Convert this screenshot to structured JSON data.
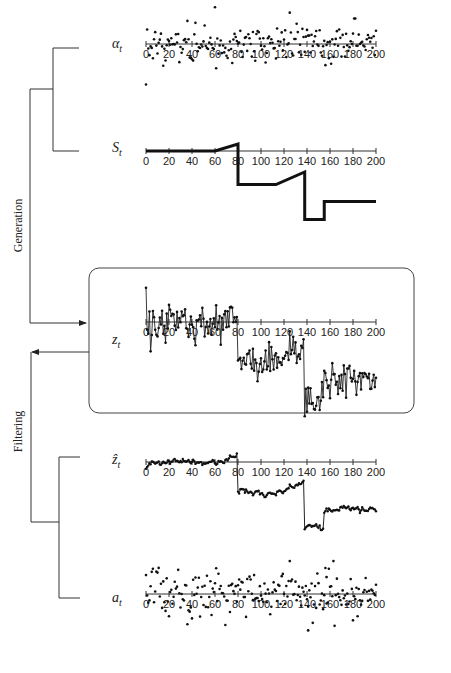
{
  "diagram": {
    "sections": {
      "generation_label": "Generation",
      "filtering_label": "Filtering"
    },
    "panels": [
      {
        "id": "alpha",
        "symbol": "α",
        "subscript": "t",
        "kind": "scatter",
        "description": "noise innovations"
      },
      {
        "id": "S",
        "symbol": "S",
        "subscript": "t",
        "kind": "step",
        "description": "structural signal"
      },
      {
        "id": "z",
        "symbol": "z",
        "subscript": "t",
        "kind": "line-markers",
        "description": "observed series (boxed)"
      },
      {
        "id": "zhat",
        "symbol": "ẑ",
        "subscript": "t",
        "kind": "line-markers",
        "description": "filtered series"
      },
      {
        "id": "a",
        "symbol": "a",
        "subscript": "t",
        "kind": "scatter",
        "description": "residuals"
      }
    ],
    "axis": {
      "ticks": [
        "0",
        "20",
        "40",
        "60",
        "80",
        "100",
        "120",
        "140",
        "160",
        "180",
        "200"
      ],
      "xmin": 0,
      "xmax": 200
    }
  },
  "chart_data": [
    {
      "type": "scatter",
      "title": "α_t",
      "x_range": [
        0,
        200
      ],
      "ticks": [
        0,
        20,
        40,
        60,
        80,
        100,
        120,
        140,
        160,
        180,
        200
      ],
      "seed": 11,
      "amplitude": 1.0,
      "note": "random white noise around zero, 200 points"
    },
    {
      "type": "line",
      "title": "S_t",
      "x_range": [
        0,
        200
      ],
      "ticks": [
        0,
        20,
        40,
        60,
        80,
        100,
        120,
        140,
        160,
        180,
        200
      ],
      "segments": [
        {
          "x": [
            0,
            60
          ],
          "y": [
            0,
            0
          ]
        },
        {
          "x": [
            60,
            80
          ],
          "y": [
            0,
            0.5
          ]
        },
        {
          "x": [
            80,
            80
          ],
          "y": [
            0.5,
            -2.4
          ]
        },
        {
          "x": [
            80,
            113
          ],
          "y": [
            -2.4,
            -2.4
          ]
        },
        {
          "x": [
            113,
            138
          ],
          "y": [
            -2.4,
            -1.5
          ]
        },
        {
          "x": [
            138,
            138
          ],
          "y": [
            -1.5,
            -4.9
          ]
        },
        {
          "x": [
            138,
            155
          ],
          "y": [
            -4.9,
            -4.9
          ]
        },
        {
          "x": [
            155,
            155
          ],
          "y": [
            -4.9,
            -3.6
          ]
        },
        {
          "x": [
            155,
            200
          ],
          "y": [
            -3.6,
            -3.6
          ]
        }
      ]
    },
    {
      "type": "line",
      "title": "z_t",
      "x_range": [
        0,
        200
      ],
      "ticks": [
        0,
        20,
        40,
        60,
        80,
        100,
        120,
        140,
        160,
        180,
        200
      ],
      "note": "S_t plus noise, markers on each point"
    },
    {
      "type": "line",
      "title": "ẑ_t",
      "x_range": [
        0,
        200
      ],
      "ticks": [
        0,
        20,
        40,
        60,
        80,
        100,
        120,
        140,
        160,
        180,
        200
      ],
      "note": "smoothed/filtered version of z_t"
    },
    {
      "type": "scatter",
      "title": "a_t",
      "x_range": [
        0,
        200
      ],
      "ticks": [
        0,
        20,
        40,
        60,
        80,
        100,
        120,
        140,
        160,
        180,
        200
      ],
      "seed": 29,
      "amplitude": 1.0,
      "outliers": [
        {
          "x": 141,
          "y": -2.8
        },
        {
          "x": 157,
          "y": 1.3
        }
      ],
      "note": "residuals, large outliers near t=140"
    }
  ]
}
